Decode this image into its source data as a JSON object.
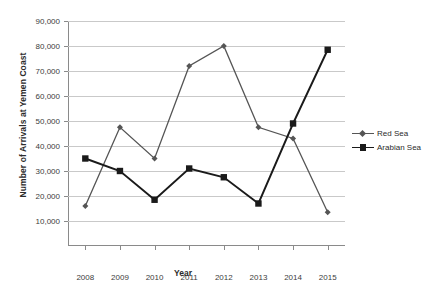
{
  "chart_data": {
    "type": "line",
    "title": "",
    "xlabel": "Year",
    "ylabel": "Number of Arrivals at Yemen Coast",
    "categories": [
      "2008",
      "2009",
      "2010",
      "2011",
      "2012",
      "2013",
      "2014",
      "2015"
    ],
    "x": [
      2008,
      2009,
      2010,
      2011,
      2012,
      2013,
      2014,
      2015
    ],
    "ylim": [
      0,
      90000
    ],
    "ytick_labels": [
      "10,000",
      "20,000",
      "30,000",
      "40,000",
      "50,000",
      "60,000",
      "70,000",
      "80,000",
      "90,000"
    ],
    "ytick_values": [
      10000,
      20000,
      30000,
      40000,
      50000,
      60000,
      70000,
      80000,
      90000
    ],
    "grid": true,
    "legend_position": "right",
    "series": [
      {
        "name": "Red Sea",
        "marker": "diamond",
        "color": "#555555",
        "values": [
          16000,
          47500,
          35000,
          72000,
          80000,
          47500,
          43000,
          13500
        ]
      },
      {
        "name": "Arabian Sea",
        "marker": "square",
        "color": "#1a1a1a",
        "values": [
          35000,
          30000,
          18500,
          31000,
          27500,
          17000,
          49000,
          78500
        ]
      }
    ]
  },
  "legend": {
    "items": [
      {
        "label": "Red Sea"
      },
      {
        "label": "Arabian Sea"
      }
    ]
  },
  "axes": {
    "y_title": "Number of Arrivals at Yemen Coast",
    "x_title": "Year"
  }
}
